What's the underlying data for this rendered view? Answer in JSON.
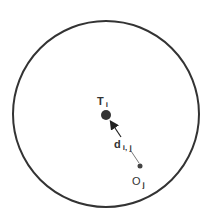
{
  "diagram": {
    "boundary": {
      "cx": 106,
      "cy": 114,
      "r": 93,
      "stroke": "#333333"
    },
    "target": {
      "symbol": "T",
      "subscript": "i",
      "x": 106,
      "y": 115,
      "r": 5
    },
    "origin": {
      "symbol": "O",
      "subscript": "j",
      "x": 140,
      "y": 166,
      "r": 2.5
    },
    "distance": {
      "symbol": "d",
      "subscript": "i, j"
    }
  }
}
